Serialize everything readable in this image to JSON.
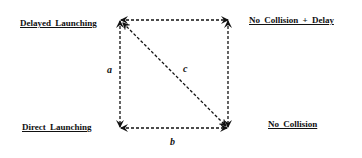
{
  "diagram": {
    "nodes": {
      "top_left": "Delayed  Launching",
      "top_right": "No  Collision  +  Delay",
      "bottom_left": "Direct  Launching",
      "bottom_right": "No  Collision"
    },
    "edges": {
      "left": "a",
      "bottom": "b",
      "diagonal": "c"
    },
    "line_color": "#111111"
  }
}
